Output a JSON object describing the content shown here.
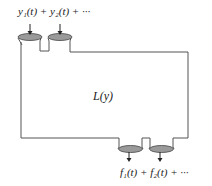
{
  "diagram": {
    "type": "system-block",
    "system_label": "L(y)",
    "inputs_label": "y₁(t) + y₂(t) + ···",
    "outputs_label": "f₁(t) + f₂(t) + ···",
    "inputs": [
      {
        "name": "y1(t)",
        "position": "top-left"
      },
      {
        "name": "y2(t)",
        "position": "top-second"
      }
    ],
    "outputs": [
      {
        "name": "f1(t)",
        "position": "bottom-first"
      },
      {
        "name": "f2(t)",
        "position": "bottom-second"
      }
    ],
    "colors": {
      "outline": "#555555",
      "nozzle_fill": "#9a9a9a",
      "text": "#222222"
    }
  }
}
